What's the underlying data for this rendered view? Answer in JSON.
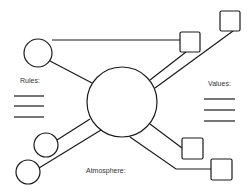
{
  "labels": {
    "rules": "Rules:",
    "values": "Values:",
    "atmosphere": "Atmosphere:"
  },
  "colors": {
    "stroke": "#1a1a1a",
    "background": "#ffffff",
    "text": "#333333"
  },
  "nodes": {
    "center": {
      "shape": "circle",
      "cx": 122,
      "cy": 102,
      "r": 35
    },
    "top_left_circle": {
      "shape": "circle",
      "cx": 38,
      "cy": 53,
      "r": 14
    },
    "bottom_left_circle_1": {
      "shape": "circle",
      "cx": 46,
      "cy": 145,
      "r": 12
    },
    "bottom_left_circle_2": {
      "shape": "circle",
      "cx": 28,
      "cy": 172,
      "r": 12
    },
    "top_right_square_1": {
      "shape": "square",
      "x": 180,
      "y": 32,
      "size": 20
    },
    "top_right_square_2": {
      "shape": "square",
      "x": 220,
      "y": 11,
      "size": 20
    },
    "bottom_right_square_1": {
      "shape": "square",
      "x": 182,
      "y": 138,
      "size": 21
    },
    "bottom_right_square_2": {
      "shape": "square",
      "x": 211,
      "y": 159,
      "size": 21
    }
  }
}
